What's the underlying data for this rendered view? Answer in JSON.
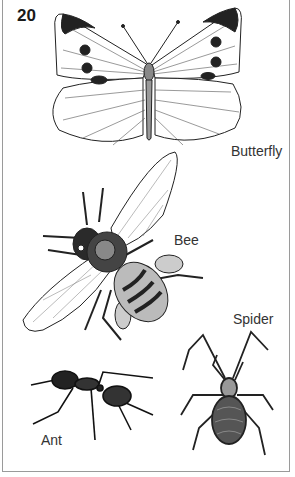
{
  "page": {
    "number": "20"
  },
  "illustrations": [
    {
      "name": "butterfly",
      "label": "Butterfly"
    },
    {
      "name": "bee",
      "label": "Bee"
    },
    {
      "name": "spider",
      "label": "Spider"
    },
    {
      "name": "ant",
      "label": "Ant"
    }
  ],
  "colors": {
    "ink": "#1a1a1a",
    "paper": "#ffffff",
    "border": "#9a9a9a"
  }
}
